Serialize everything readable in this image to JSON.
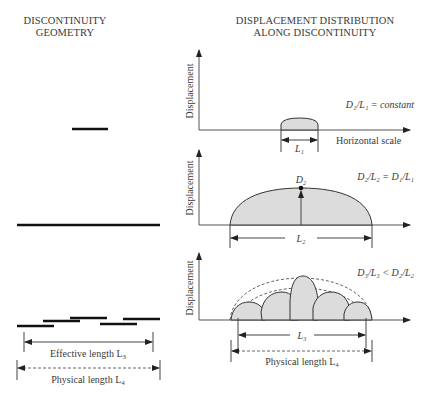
{
  "left_panel": {
    "title_line1": "DISCONTINUITY",
    "title_line2": "GEOMETRY",
    "effective_length_label": "Effective length L",
    "effective_length_sub": "3",
    "physical_length_label": "Physical length L",
    "physical_length_sub": "4"
  },
  "right_panel": {
    "title_line1": "DISPLACEMENT DISTRIBUTION",
    "title_line2": "ALONG DISCONTINUITY",
    "plots": [
      {
        "y_axis_label": "Displacement",
        "x_axis_label": "Horizontal scale",
        "ratio_label": "D₁/L₁ = constant",
        "length_label": "L₁"
      },
      {
        "y_axis_label": "Displacement",
        "peak_label": "D₂",
        "ratio_label": "D₂/L₂ = D₁/L₁",
        "length_label": "L₂"
      },
      {
        "y_axis_label": "Displacement",
        "ratio_label": "D₃/L₃ < D₂/L₂",
        "length_label": "L₃",
        "physical_length_label": "Physical length L₄"
      }
    ]
  },
  "colors": {
    "fill": "#dcdcdc",
    "line": "#333333",
    "bar": "#111111",
    "text": "#3a3a3a"
  }
}
